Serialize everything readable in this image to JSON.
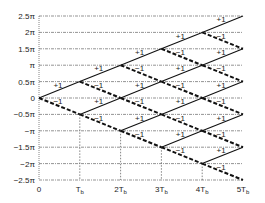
{
  "chart_data": {
    "type": "line",
    "title": "",
    "xlabel": "",
    "ylabel": "",
    "x_ticks": [
      "0",
      "T_b",
      "2T_b",
      "3T_b",
      "4T_b",
      "5T_b"
    ],
    "y_ticks": [
      "2.5π",
      "2π",
      "1.5π",
      "π",
      "0.5π",
      "0",
      "−0.5π",
      "−π",
      "−1.5π",
      "−2π",
      "−2.5π"
    ],
    "y_values": [
      2.5,
      2,
      1.5,
      1,
      0.5,
      0,
      -0.5,
      -1,
      -1.5,
      -2,
      -2.5
    ],
    "xlim": [
      0,
      5
    ],
    "ylim": [
      -2.5,
      2.5
    ],
    "grid": true,
    "legend": [
      {
        "label": "+1",
        "style": "solid"
      },
      {
        "label": "−1",
        "style": "dashed"
      }
    ],
    "segments": [
      {
        "x0": 0,
        "y0": 0,
        "x1": 1,
        "y1": 0.5,
        "bit": "+1"
      },
      {
        "x0": 0,
        "y0": 0,
        "x1": 1,
        "y1": -0.5,
        "bit": "−1"
      },
      {
        "x0": 1,
        "y0": 0.5,
        "x1": 2,
        "y1": 1,
        "bit": "+1"
      },
      {
        "x0": 1,
        "y0": 0.5,
        "x1": 2,
        "y1": 0,
        "bit": "−1"
      },
      {
        "x0": 1,
        "y0": -0.5,
        "x1": 2,
        "y1": 0,
        "bit": "+1"
      },
      {
        "x0": 1,
        "y0": -0.5,
        "x1": 2,
        "y1": -1,
        "bit": "−1"
      },
      {
        "x0": 2,
        "y0": 1,
        "x1": 3,
        "y1": 1.5,
        "bit": "+1"
      },
      {
        "x0": 2,
        "y0": 1,
        "x1": 3,
        "y1": 0.5,
        "bit": "−1"
      },
      {
        "x0": 2,
        "y0": 0,
        "x1": 3,
        "y1": 0.5,
        "bit": "+1"
      },
      {
        "x0": 2,
        "y0": 0,
        "x1": 3,
        "y1": -0.5,
        "bit": "−1"
      },
      {
        "x0": 2,
        "y0": -1,
        "x1": 3,
        "y1": -0.5,
        "bit": "+1"
      },
      {
        "x0": 2,
        "y0": -1,
        "x1": 3,
        "y1": -1.5,
        "bit": "−1"
      },
      {
        "x0": 3,
        "y0": 1.5,
        "x1": 4,
        "y1": 2,
        "bit": "+1"
      },
      {
        "x0": 3,
        "y0": 1.5,
        "x1": 4,
        "y1": 1,
        "bit": "−1"
      },
      {
        "x0": 3,
        "y0": 0.5,
        "x1": 4,
        "y1": 1,
        "bit": "+1"
      },
      {
        "x0": 3,
        "y0": 0.5,
        "x1": 4,
        "y1": 0,
        "bit": "−1"
      },
      {
        "x0": 3,
        "y0": -0.5,
        "x1": 4,
        "y1": 0,
        "bit": "+1"
      },
      {
        "x0": 3,
        "y0": -0.5,
        "x1": 4,
        "y1": -1,
        "bit": "−1"
      },
      {
        "x0": 3,
        "y0": -1.5,
        "x1": 4,
        "y1": -1,
        "bit": "+1"
      },
      {
        "x0": 3,
        "y0": -1.5,
        "x1": 4,
        "y1": -2,
        "bit": "−1"
      },
      {
        "x0": 4,
        "y0": 2,
        "x1": 5,
        "y1": 2.5,
        "bit": "+1"
      },
      {
        "x0": 4,
        "y0": 2,
        "x1": 5,
        "y1": 1.5,
        "bit": "−1"
      },
      {
        "x0": 4,
        "y0": 1,
        "x1": 5,
        "y1": 1.5,
        "bit": "+1"
      },
      {
        "x0": 4,
        "y0": 1,
        "x1": 5,
        "y1": 0.5,
        "bit": "−1"
      },
      {
        "x0": 4,
        "y0": 0,
        "x1": 5,
        "y1": 0.5,
        "bit": "+1"
      },
      {
        "x0": 4,
        "y0": 0,
        "x1": 5,
        "y1": -0.5,
        "bit": "−1"
      },
      {
        "x0": 4,
        "y0": -1,
        "x1": 5,
        "y1": -0.5,
        "bit": "+1"
      },
      {
        "x0": 4,
        "y0": -1,
        "x1": 5,
        "y1": -1.5,
        "bit": "−1"
      },
      {
        "x0": 4,
        "y0": -2,
        "x1": 5,
        "y1": -1.5,
        "bit": "+1"
      },
      {
        "x0": 4,
        "y0": -2,
        "x1": 5,
        "y1": -2.5,
        "bit": "−1"
      }
    ],
    "vertical_guides": [
      {
        "x": 1,
        "from_y": -0.5
      },
      {
        "x": 2,
        "from_y": -1
      },
      {
        "x": 3,
        "from_y": -1.5
      },
      {
        "x": 4,
        "from_y": -2
      }
    ]
  },
  "colors": {
    "line": "#111111",
    "grid": "#666666",
    "text": "#222222"
  }
}
